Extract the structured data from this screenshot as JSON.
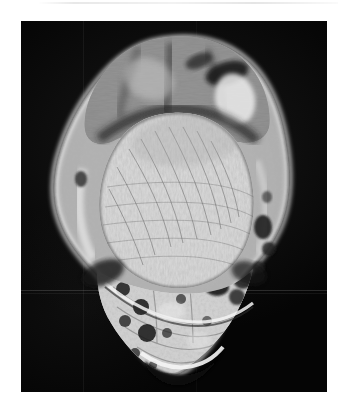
{
  "page": {
    "background_color": "#ffffff",
    "width": 346,
    "height": 410
  },
  "artifacts": {
    "top_streak_name": "scanner-streak"
  },
  "figure": {
    "name": "mri-scan",
    "modality": "MRI",
    "plane": "axial/coronal oblique",
    "body_part": "heel and hindfoot (calcaneus)",
    "background_color": "#050505",
    "bounds": {
      "left": 21,
      "top": 21,
      "width": 306,
      "height": 371
    },
    "caption_text": "",
    "regions": [
      {
        "name": "achilles-tendon-and-posterior-soft-tissue",
        "label": "posterior soft tissue"
      },
      {
        "name": "calcaneus-body",
        "label": "calcaneus"
      },
      {
        "name": "trabecular-bone-texture",
        "label": "trabecular marrow"
      },
      {
        "name": "heel-fat-pad",
        "label": "heel fat pad"
      },
      {
        "name": "plantar-fascia",
        "label": "plantar fascia"
      },
      {
        "name": "skin-line",
        "label": "skin surface"
      },
      {
        "name": "vascular-foci",
        "label": "vessels"
      }
    ]
  }
}
